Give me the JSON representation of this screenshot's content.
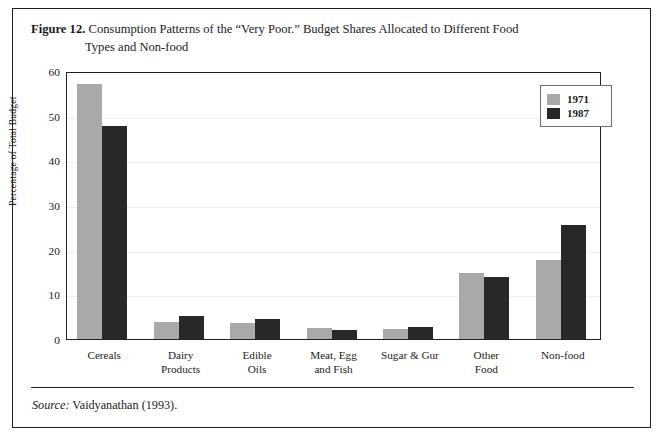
{
  "figure": {
    "label": "Figure 12.",
    "caption_line1": "Consumption Patterns of the “Very Poor.” Budget Shares Allocated to Different Food",
    "caption_line2": "Types and Non-food",
    "source_word": "Source:",
    "source_text": " Vaidyanathan (1993)."
  },
  "legend": {
    "position": "top-right",
    "entries": [
      {
        "label": "1971",
        "color": "#a9a9a9"
      },
      {
        "label": "1987",
        "color": "#282828"
      }
    ]
  },
  "chart_data": {
    "type": "bar",
    "title": "Consumption Patterns of the “Very Poor.” Budget Shares Allocated to Different Food Types and Non-food",
    "xlabel": "",
    "ylabel": "Percentage of Total Budget",
    "ylim": [
      0,
      60
    ],
    "yticks": [
      0,
      10,
      20,
      30,
      40,
      50,
      60
    ],
    "grid": true,
    "categories": [
      "Cereals",
      "Dairy\nProducts",
      "Edible\nOils",
      "Meat, Egg\nand Fish",
      "Sugar & Gur",
      "Other\nFood",
      "Non-food"
    ],
    "series": [
      {
        "name": "1971",
        "color": "#a9a9a9",
        "values": [
          57.2,
          3.9,
          3.6,
          2.5,
          2.3,
          14.7,
          17.6
        ]
      },
      {
        "name": "1987",
        "color": "#282828",
        "values": [
          47.7,
          5.2,
          4.4,
          2.1,
          2.7,
          13.8,
          25.6
        ]
      }
    ]
  }
}
